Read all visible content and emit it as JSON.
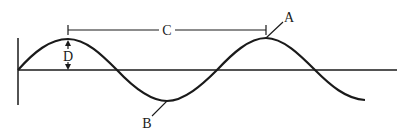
{
  "diagram": {
    "type": "transverse-wave",
    "labels": {
      "A": "A",
      "B": "B",
      "C": "C",
      "D": "D"
    },
    "label_meaning_visual": {
      "A": "crest",
      "B": "trough",
      "C": "crest-to-crest distance",
      "D": "crest-to-rest-line height"
    },
    "colors": {
      "line": "#1a1a1a",
      "background": "#ffffff"
    }
  }
}
